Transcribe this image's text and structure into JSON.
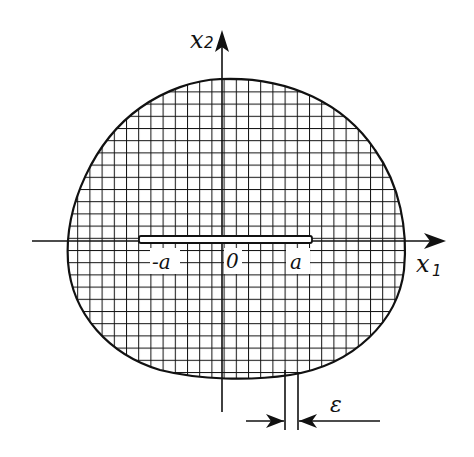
{
  "figure": {
    "colors": {
      "ink": "#111111",
      "background": "#ffffff",
      "crack_fill": "#ffffff"
    }
  },
  "axes": {
    "x1": {
      "label": "x",
      "subscript": "1"
    },
    "x2": {
      "label": "x",
      "subscript": "2"
    },
    "origin_label": "0"
  },
  "crack": {
    "left_tip_label": "-a",
    "right_tip_label": "a"
  },
  "dimension": {
    "label": "ε"
  }
}
